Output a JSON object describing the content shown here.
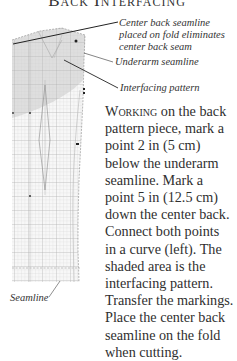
{
  "title": "Back Interfacing",
  "figure": {
    "labels": {
      "center_back": [
        "Center back seamline",
        "placed on fold eliminates",
        "center back seam"
      ],
      "underarm": "Underarm seamline",
      "interfacing": "Interfacing pattern",
      "seamline": "Seamline"
    },
    "colors": {
      "grid": "#c9c9c9",
      "grid_major": "#a8a8a8",
      "shading": "#e3e3e3",
      "line": "#222222"
    }
  },
  "body": {
    "lead_word": "Working",
    "lines": [
      " on the back",
      "pattern piece, mark a",
      "point 2 in (5 cm)",
      "below the underarm",
      "seamline. Mark a",
      "point 5 in (12.5 cm)",
      "down the center back.",
      "Connect both points",
      "in a curve (left). The",
      "shaded area is the",
      "interfacing pattern.",
      "Transfer the markings.",
      "Place the center back",
      "seamline on the fold",
      "when cutting."
    ]
  }
}
